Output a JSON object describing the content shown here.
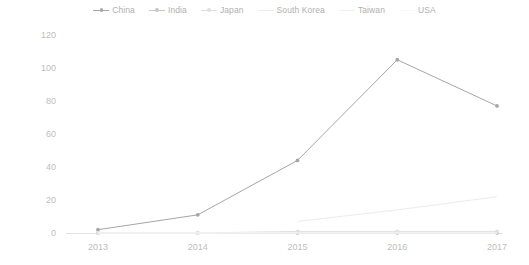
{
  "chart_data": {
    "type": "line",
    "title": "",
    "subtitle": "",
    "xlabel": "",
    "ylabel": "",
    "categories": [
      "2013",
      "2014",
      "2015",
      "2016",
      "2017"
    ],
    "ylim": [
      0,
      120
    ],
    "yticks": [
      0,
      20,
      40,
      60,
      80,
      100,
      120
    ],
    "grid": false,
    "legend_position": "top-center",
    "series": [
      {
        "name": "China",
        "color": "#a6a6a6",
        "marker": "circle",
        "values": [
          2,
          11,
          44,
          105,
          77
        ]
      },
      {
        "name": "India",
        "color": "#c9c9c9",
        "marker": "circle",
        "values": [
          0,
          0,
          0,
          0,
          0
        ]
      },
      {
        "name": "Japan",
        "color": "#e0e0e0",
        "marker": "circle",
        "values": [
          0,
          0,
          1,
          1,
          1
        ]
      },
      {
        "name": "South Korea",
        "color": "#ececec",
        "marker": "none",
        "values": [
          null,
          null,
          7,
          14,
          22
        ]
      },
      {
        "name": "Taiwan",
        "color": "#f0f0f0",
        "marker": "none",
        "values": [
          0,
          0,
          0,
          0,
          0
        ]
      },
      {
        "name": "USA",
        "color": "#f7f7f7",
        "marker": "none",
        "values": [
          0,
          0,
          0,
          0,
          0
        ]
      }
    ]
  },
  "legend": {
    "items": [
      {
        "label": "China"
      },
      {
        "label": "India"
      },
      {
        "label": "Japan"
      },
      {
        "label": "South Korea"
      },
      {
        "label": "Taiwan"
      },
      {
        "label": "USA"
      }
    ]
  }
}
